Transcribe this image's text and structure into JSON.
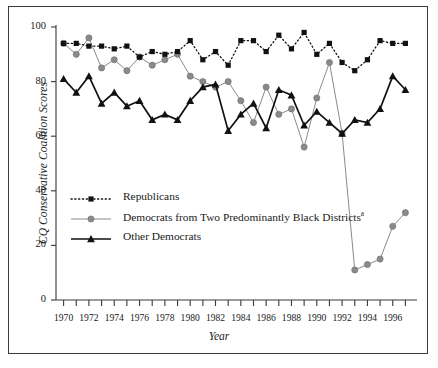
{
  "chart_data": {
    "type": "line",
    "title": "",
    "xlabel": "Year",
    "ylabel": "CQ Conservative Coalition Scores",
    "xlim": [
      1969.4,
      1997.6
    ],
    "ylim": [
      0,
      100
    ],
    "grid": false,
    "legend_position": "inside-lower-left",
    "x": [
      1970,
      1971,
      1972,
      1973,
      1974,
      1975,
      1976,
      1977,
      1978,
      1979,
      1980,
      1981,
      1982,
      1983,
      1984,
      1985,
      1986,
      1987,
      1988,
      1989,
      1990,
      1991,
      1992,
      1993,
      1994,
      1995,
      1996,
      1997
    ],
    "yticks": [
      0,
      20,
      40,
      60,
      80,
      100
    ],
    "xticks": [
      1970,
      1971,
      1972,
      1973,
      1974,
      1975,
      1976,
      1977,
      1978,
      1979,
      1980,
      1981,
      1982,
      1983,
      1984,
      1985,
      1986,
      1987,
      1988,
      1989,
      1990,
      1991,
      1992,
      1993,
      1994,
      1995,
      1996,
      1997
    ],
    "xtick_labels": [
      "1970",
      "",
      "1972",
      "",
      "1974",
      "",
      "1976",
      "",
      "1978",
      "",
      "1980",
      "",
      "1982",
      "",
      "1984",
      "",
      "1986",
      "",
      "1988",
      "",
      "1990",
      "",
      "1992",
      "",
      "1994",
      "",
      "1996",
      ""
    ],
    "series": [
      {
        "name": "Republicans",
        "marker": "square",
        "line_style": "dotted",
        "color": "#111111",
        "values": [
          94,
          94,
          93,
          93,
          92,
          93,
          89,
          91,
          90,
          91,
          95,
          88,
          91,
          86,
          95,
          95,
          91,
          97,
          92,
          98,
          90,
          94,
          87,
          84,
          88,
          95,
          94,
          94
        ]
      },
      {
        "name": "Democrats from Two Predominantly Black Districts",
        "footnote": "a",
        "marker": "circle",
        "line_style": "solid",
        "color": "#8a8a8a",
        "values": [
          94,
          90,
          96,
          85,
          88,
          84,
          89,
          86,
          88,
          90,
          82,
          80,
          78,
          80,
          73,
          65,
          78,
          68,
          70,
          56,
          74,
          87,
          61,
          11,
          13,
          15,
          27,
          32
        ]
      },
      {
        "name": "Other Democrats",
        "marker": "triangle",
        "line_style": "solid",
        "color": "#111111",
        "values": [
          81,
          76,
          82,
          72,
          76,
          71,
          73,
          66,
          68,
          66,
          73,
          78,
          79,
          62,
          68,
          72,
          63,
          77,
          75,
          64,
          69,
          65,
          61,
          66,
          65,
          70,
          82,
          77
        ]
      }
    ]
  },
  "legend": {
    "items": [
      {
        "label": "Republicans",
        "footnote": ""
      },
      {
        "label": "Democrats from Two Predominantly Black Districts",
        "footnote": "a"
      },
      {
        "label": "Other Democrats",
        "footnote": ""
      }
    ]
  },
  "axes": {
    "y_title": "CQ Conservative Coalition Scores",
    "x_title": "Year"
  }
}
